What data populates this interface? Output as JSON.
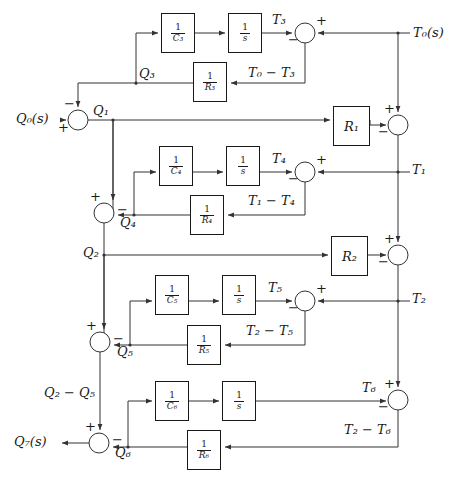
{
  "diagram": {
    "type": "control-system-block-diagram",
    "width": 463,
    "height": 480,
    "line_color": "#333333",
    "text_color": "#1a1a1a",
    "background": "#ffffff"
  },
  "inputs": [
    {
      "name": "input-q0",
      "label": "Q₀(s)",
      "sym": "Q",
      "subscript": "0",
      "suffix": "(s)"
    },
    {
      "name": "output-t0",
      "label": "T₀(s)",
      "sym": "T",
      "subscript": "0",
      "suffix": "(s)"
    },
    {
      "name": "output-q7",
      "label": "Q₇(s)",
      "sym": "Q",
      "subscript": "7",
      "suffix": "(s)"
    }
  ],
  "blocks": [
    {
      "id": "c3",
      "name": "block-one-over-c3",
      "num": "1",
      "den": "C₃",
      "x": 161,
      "y": 13,
      "w": 34,
      "h": 40
    },
    {
      "id": "s1",
      "name": "block-integrator-1",
      "num": "1",
      "den": "s",
      "x": 228,
      "y": 13,
      "w": 34,
      "h": 40
    },
    {
      "id": "r3",
      "name": "block-one-over-r3",
      "num": "1",
      "den": "R₃",
      "x": 193,
      "y": 62,
      "w": 34,
      "h": 40
    },
    {
      "id": "r1",
      "name": "block-gain-r1",
      "gain": "R₁",
      "x": 333,
      "y": 106,
      "w": 37,
      "h": 40
    },
    {
      "id": "c4",
      "name": "block-one-over-c4",
      "num": "1",
      "den": "C₄",
      "x": 159,
      "y": 146,
      "w": 34,
      "h": 40
    },
    {
      "id": "s2",
      "name": "block-integrator-2",
      "num": "1",
      "den": "s",
      "x": 226,
      "y": 146,
      "w": 34,
      "h": 40
    },
    {
      "id": "r4",
      "name": "block-one-over-r4",
      "num": "1",
      "den": "R₄",
      "x": 190,
      "y": 195,
      "w": 34,
      "h": 40
    },
    {
      "id": "r2",
      "name": "block-gain-r2",
      "gain": "R₂",
      "x": 331,
      "y": 236,
      "w": 37,
      "h": 40
    },
    {
      "id": "c5",
      "name": "block-one-over-c5",
      "num": "1",
      "den": "C₅",
      "x": 155,
      "y": 275,
      "w": 34,
      "h": 40
    },
    {
      "id": "s3",
      "name": "block-integrator-3",
      "num": "1",
      "den": "s",
      "x": 222,
      "y": 275,
      "w": 34,
      "h": 40
    },
    {
      "id": "r5",
      "name": "block-one-over-r5",
      "num": "1",
      "den": "R₅",
      "x": 187,
      "y": 325,
      "w": 34,
      "h": 40
    },
    {
      "id": "c6",
      "name": "block-one-over-c6",
      "num": "1",
      "den": "C₆",
      "x": 155,
      "y": 381,
      "w": 34,
      "h": 40
    },
    {
      "id": "s4",
      "name": "block-integrator-4",
      "num": "1",
      "den": "s",
      "x": 222,
      "y": 381,
      "w": 34,
      "h": 40
    },
    {
      "id": "r6",
      "name": "block-one-over-r6",
      "num": "1",
      "den": "R₆",
      "x": 187,
      "y": 430,
      "w": 34,
      "h": 40
    }
  ],
  "summing_junctions": [
    {
      "id": "sum-t3",
      "name": "summing-junction-t3",
      "cx": 305,
      "cy": 33,
      "r": 10,
      "signs": [
        {
          "s": "−",
          "x": 288,
          "y": 38
        },
        {
          "s": "+",
          "x": 318,
          "y": 18
        }
      ]
    },
    {
      "id": "sum-q1",
      "name": "summing-junction-q1",
      "cx": 78,
      "cy": 120,
      "r": 10,
      "signs": [
        {
          "s": "−",
          "x": 65,
          "y": 98
        },
        {
          "s": "+",
          "x": 58,
          "y": 124
        }
      ]
    },
    {
      "id": "sum-t1",
      "name": "summing-junction-t1",
      "cx": 398,
      "cy": 125,
      "r": 10,
      "signs": [
        {
          "s": "+",
          "x": 386,
          "y": 103
        },
        {
          "s": "−",
          "x": 379,
          "y": 129
        }
      ]
    },
    {
      "id": "sum-t4",
      "name": "summing-junction-t4",
      "cx": 305,
      "cy": 172,
      "r": 10,
      "signs": [
        {
          "s": "−",
          "x": 288,
          "y": 177
        },
        {
          "s": "+",
          "x": 318,
          "y": 157
        }
      ]
    },
    {
      "id": "sum-q4",
      "name": "summing-junction-q4",
      "cx": 104,
      "cy": 213,
      "r": 10,
      "signs": [
        {
          "s": "+",
          "x": 91,
          "y": 191
        },
        {
          "s": "−",
          "x": 118,
          "y": 206
        }
      ]
    },
    {
      "id": "sum-t2",
      "name": "summing-junction-t2",
      "cx": 398,
      "cy": 255,
      "r": 10,
      "signs": [
        {
          "s": "+",
          "x": 386,
          "y": 233
        },
        {
          "s": "−",
          "x": 379,
          "y": 259
        }
      ]
    },
    {
      "id": "sum-t5",
      "name": "summing-junction-t5",
      "cx": 305,
      "cy": 301,
      "r": 10,
      "signs": [
        {
          "s": "−",
          "x": 288,
          "y": 306
        },
        {
          "s": "+",
          "x": 318,
          "y": 286
        }
      ]
    },
    {
      "id": "sum-q5",
      "name": "summing-junction-q5",
      "cx": 100,
      "cy": 342,
      "r": 10,
      "signs": [
        {
          "s": "+",
          "x": 87,
          "y": 320
        },
        {
          "s": "−",
          "x": 114,
          "y": 335
        }
      ]
    },
    {
      "id": "sum-t6",
      "name": "summing-junction-t6",
      "cx": 398,
      "cy": 400,
      "r": 10,
      "signs": [
        {
          "s": "+",
          "x": 386,
          "y": 378
        },
        {
          "s": "−",
          "x": 379,
          "y": 404
        }
      ]
    },
    {
      "id": "sum-q6",
      "name": "summing-junction-q6",
      "cx": 99,
      "cy": 443,
      "r": 10,
      "signs": [
        {
          "s": "+",
          "x": 86,
          "y": 421
        },
        {
          "s": "−",
          "x": 113,
          "y": 436
        }
      ]
    }
  ],
  "signals": [
    {
      "id": "q0s",
      "name": "signal-label-q0s",
      "text": "Q₀(s)",
      "x": 16,
      "y": 113
    },
    {
      "id": "q1",
      "name": "signal-label-q1",
      "text": "Q₁",
      "x": 93,
      "y": 106
    },
    {
      "id": "q3",
      "name": "signal-label-q3",
      "text": "Q₃",
      "x": 139,
      "y": 69
    },
    {
      "id": "t3",
      "name": "signal-label-t3",
      "text": "T₃",
      "x": 272,
      "y": 14
    },
    {
      "id": "t0s",
      "name": "signal-label-t0s",
      "text": "T₀(s)",
      "x": 413,
      "y": 28
    },
    {
      "id": "t0mt3",
      "name": "signal-label-t0-minus-t3",
      "text": "T₀ − T₃",
      "x": 250,
      "y": 68
    },
    {
      "id": "t4",
      "name": "signal-label-t4",
      "text": "T₄",
      "x": 272,
      "y": 153
    },
    {
      "id": "t1",
      "name": "signal-label-t1",
      "text": "T₁",
      "x": 412,
      "y": 164
    },
    {
      "id": "q4",
      "name": "signal-label-q4",
      "text": "Q₄",
      "x": 120,
      "y": 218
    },
    {
      "id": "t1mt4",
      "name": "signal-label-t1-minus-t4",
      "text": "T₁ − T₄",
      "x": 250,
      "y": 196
    },
    {
      "id": "q2",
      "name": "signal-label-q2",
      "text": "Q₂",
      "x": 87,
      "y": 248
    },
    {
      "id": "t5",
      "name": "signal-label-t5",
      "text": "T₅",
      "x": 268,
      "y": 282
    },
    {
      "id": "t2",
      "name": "signal-label-t2",
      "text": "T₂",
      "x": 412,
      "y": 294
    },
    {
      "id": "q5",
      "name": "signal-label-q5",
      "text": "Q₅",
      "x": 117,
      "y": 347
    },
    {
      "id": "t2mt5",
      "name": "signal-label-t2-minus-t5",
      "text": "T₂ − T₅",
      "x": 248,
      "y": 326
    },
    {
      "id": "q2mq5",
      "name": "signal-label-q2-minus-q5",
      "text": "Q₂ − Q₅",
      "x": 47,
      "y": 388
    },
    {
      "id": "t6",
      "name": "signal-label-t6",
      "text": "T₆",
      "x": 363,
      "y": 382
    },
    {
      "id": "q7s",
      "name": "signal-label-q7s",
      "text": "Q₇(s)",
      "x": 16,
      "y": 436
    },
    {
      "id": "q6",
      "name": "signal-label-q6",
      "text": "Q₆",
      "x": 115,
      "y": 448
    },
    {
      "id": "t2mt6",
      "name": "signal-label-t2-minus-t6",
      "text": "T₂ − T₆",
      "x": 345,
      "y": 425
    }
  ]
}
